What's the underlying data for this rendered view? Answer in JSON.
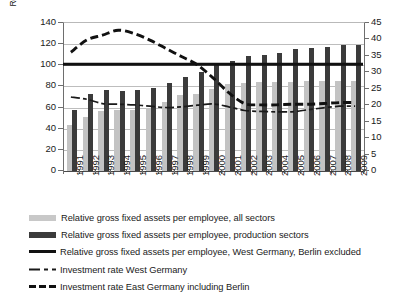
{
  "chart_data": {
    "type": "bar",
    "title": "",
    "subtitle": "",
    "xlabel": "",
    "ylabel": "Relative gross  fixed assets per empoyee (West Germany = 100%)",
    "ylabel_secondary": "Investment rate, % of GDP",
    "categories": [
      "1991",
      "1992",
      "1993",
      "1994",
      "1995",
      "1996",
      "1997",
      "1998",
      "1999",
      "2000",
      "2001",
      "2002",
      "2003",
      "2004",
      "2005",
      "2006",
      "2007",
      "2008",
      "2009"
    ],
    "ylim": [
      0,
      140
    ],
    "yticks": [
      0,
      20,
      40,
      60,
      80,
      100,
      120,
      140
    ],
    "ylim_secondary": [
      0,
      45
    ],
    "yticks_secondary": [
      0,
      5,
      10,
      15,
      20,
      25,
      30,
      35,
      40,
      45
    ],
    "grid": true,
    "legend_position": "below",
    "series": [
      {
        "name": "Relative gross fixed assets per employee, all sectors",
        "type": "bar",
        "axis": "left",
        "color": "#c3c3c3",
        "values": [
          44,
          51,
          57,
          58,
          58,
          60,
          65,
          72,
          73,
          78,
          82,
          83,
          84,
          84,
          84,
          85,
          85,
          85,
          85
        ]
      },
      {
        "name": "Relative gross fixed assets per employee, production sectors",
        "type": "bar",
        "axis": "left",
        "color": "#3b3b3b",
        "values": [
          58,
          73,
          77,
          76,
          77,
          79,
          83,
          89,
          94,
          100,
          104,
          109,
          110,
          112,
          115,
          116,
          117,
          119,
          119
        ]
      },
      {
        "name": "Relative gross fixed assets per employee, West Germany, Berlin excluded",
        "type": "line",
        "axis": "left",
        "color": "#111111",
        "style": "solid",
        "values": [
          100,
          100,
          100,
          100,
          100,
          100,
          100,
          100,
          100,
          100,
          100,
          100,
          100,
          100,
          100,
          100,
          100,
          100,
          100
        ]
      },
      {
        "name": "Investment rate West Germany",
        "type": "line",
        "axis": "right",
        "color": "#1a1a1a",
        "style": "dash-dot",
        "values": [
          22.2,
          21.5,
          20.2,
          20.0,
          19.8,
          19.4,
          19.0,
          19.2,
          19.7,
          20.1,
          19.2,
          18.1,
          17.8,
          17.7,
          17.7,
          18.3,
          18.9,
          19.4,
          19.4
        ]
      },
      {
        "name": "Investment rate East Germany including Berlin",
        "type": "line",
        "axis": "right",
        "color": "#111111",
        "style": "dashed",
        "values": [
          35.8,
          39.5,
          41.0,
          42.5,
          41.5,
          39.5,
          37.0,
          34.5,
          32.0,
          28.0,
          23.5,
          20.2,
          19.8,
          19.8,
          20.0,
          20.0,
          20.2,
          20.5,
          20.5
        ]
      }
    ]
  },
  "axes": {
    "left": {
      "title": "Relative gross  fixed assets per empoyee (West Germany = 100%)",
      "ticks": [
        "0",
        "20",
        "40",
        "60",
        "80",
        "100",
        "120",
        "140"
      ]
    },
    "right": {
      "title": "Investment rate, % of GDP",
      "ticks": [
        "0",
        "5",
        "10",
        "15",
        "20",
        "25",
        "30",
        "35",
        "40",
        "45"
      ]
    },
    "x": {
      "ticks": [
        "1991",
        "1992",
        "1993",
        "1994",
        "1995",
        "1996",
        "1997",
        "1998",
        "1999",
        "2000",
        "2001",
        "2002",
        "2003",
        "2004",
        "2005",
        "2006",
        "2007",
        "2008",
        "2009"
      ]
    }
  },
  "legend": {
    "items": [
      {
        "marker": "swatch-light-gray",
        "label": "Relative gross fixed assets per employee, all sectors"
      },
      {
        "marker": "swatch-dark-gray",
        "label": "Relative gross fixed assets per employee, production sectors"
      },
      {
        "marker": "line-solid-thick",
        "label": "Relative gross fixed assets per employee, West Germany, Berlin excluded"
      },
      {
        "marker": "line-dash-dot-thin",
        "label": "Investment rate West Germany"
      },
      {
        "marker": "line-dashed-thick",
        "label": "Investment rate East Germany including Berlin"
      }
    ]
  },
  "colors": {
    "bar_all_sectors": "#c3c3c3",
    "bar_production": "#3b3b3b",
    "reference_line": "#111111",
    "grid": "#bdbdbd",
    "axis": "#6e6e6e",
    "background": "#ffffff"
  }
}
